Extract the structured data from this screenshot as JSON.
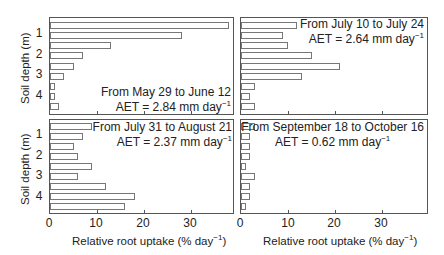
{
  "chart_data": {
    "type": "bar",
    "orientation": "horizontal",
    "layout": "2x2 panels",
    "xlabel": "Relative root uptake (% day⁻¹)",
    "ylabel": "Soil depth (m)",
    "xlim": [
      0,
      39
    ],
    "x_ticks": [
      "0",
      "10",
      "20",
      "30"
    ],
    "y_ticks": [
      "1",
      "2",
      "3",
      "4"
    ],
    "grid": false,
    "panels": [
      {
        "id": "top-left",
        "period": "From May 29 to June 12",
        "aet": "AET = 2.84 mm day",
        "values": [
          38,
          28,
          13,
          7,
          5,
          3,
          1,
          1,
          2
        ]
      },
      {
        "id": "top-right",
        "period": "From July 10 to July  24",
        "aet": "AET = 2.64 mm day",
        "values": [
          12,
          9,
          10,
          15,
          21,
          13,
          3,
          2,
          3
        ]
      },
      {
        "id": "bottom-left",
        "period": "From July 31 to August 21",
        "aet": "AET = 2.37 mm day",
        "values": [
          9,
          7,
          5,
          6,
          9,
          6,
          12,
          18,
          16
        ]
      },
      {
        "id": "bottom-right",
        "period": "From September 18 to October 16",
        "aet": "AET = 0.62 mm day",
        "values": [
          3,
          2,
          2,
          2,
          1,
          3,
          2,
          2,
          1
        ]
      }
    ]
  },
  "labels": {
    "ytitle": "Soil depth (m)",
    "xtitle": "Relative root uptake (% day",
    "xtitle_close": ")",
    "sup": "−1",
    "y1": "1",
    "y2": "2",
    "y3": "3",
    "y4": "4",
    "x0": "0",
    "x10": "10",
    "x20": "20",
    "x30": "30"
  }
}
